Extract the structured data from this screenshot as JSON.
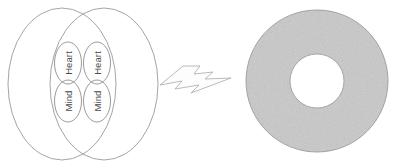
{
  "figure": {
    "background_color": "#ffffff",
    "width": 396,
    "height": 168
  },
  "venn": {
    "name": "overlapping-ellipses-group",
    "outline_color": "#9a9a9a",
    "left_ellipse_label": "",
    "right_ellipse_label": "",
    "lobes": [
      {
        "id": "heart-left",
        "label": "Heart",
        "position": "top-left"
      },
      {
        "id": "heart-right",
        "label": "Heart",
        "position": "top-right"
      },
      {
        "id": "mind-left",
        "label": "Mind",
        "position": "bottom-left"
      },
      {
        "id": "mind-right",
        "label": "Mind",
        "position": "bottom-right"
      }
    ],
    "label_rotation_degrees": -90,
    "label_color": "#4a4a4a"
  },
  "connector": {
    "name": "lightning-bolt-arrow",
    "shape": "lightning-bolt",
    "direction": "left-to-right",
    "fill_color": "#fdfdfd",
    "stroke_color": "#a8a8a8",
    "label": ""
  },
  "ring": {
    "name": "gray-annulus",
    "shape": "annulus",
    "fill_color": "#c9c9c9",
    "hole_color": "#ffffff",
    "stroke_color": "#9c9c9c",
    "center_x": 317,
    "center_y": 81,
    "outer_radius": 71,
    "inner_radius": 27,
    "label": ""
  }
}
